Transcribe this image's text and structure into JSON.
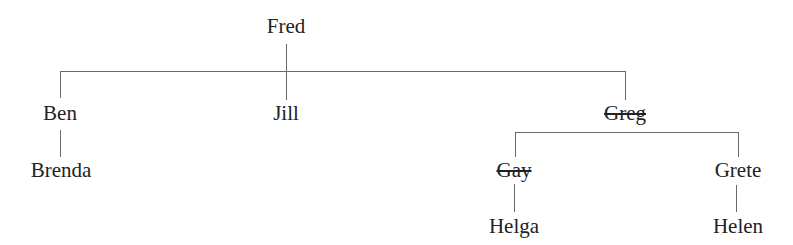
{
  "diagram": {
    "type": "family-tree",
    "line_color": "#6a6a6a",
    "text_color": "#222222",
    "nodes": {
      "fred": {
        "label": "Fred",
        "struck": false
      },
      "ben": {
        "label": "Ben",
        "struck": false
      },
      "jill": {
        "label": "Jill",
        "struck": false
      },
      "greg": {
        "label": "Greg",
        "struck": true
      },
      "brenda": {
        "label": "Brenda",
        "struck": false
      },
      "gay": {
        "label": "Gay",
        "struck": true
      },
      "grete": {
        "label": "Grete",
        "struck": false
      },
      "helga": {
        "label": "Helga",
        "struck": false
      },
      "helen": {
        "label": "Helen",
        "struck": false
      }
    },
    "edges": [
      [
        "Fred",
        "Ben"
      ],
      [
        "Fred",
        "Jill"
      ],
      [
        "Fred",
        "Greg"
      ],
      [
        "Ben",
        "Brenda"
      ],
      [
        "Greg",
        "Gay"
      ],
      [
        "Greg",
        "Grete"
      ],
      [
        "Gay",
        "Helga"
      ],
      [
        "Grete",
        "Helen"
      ]
    ]
  }
}
